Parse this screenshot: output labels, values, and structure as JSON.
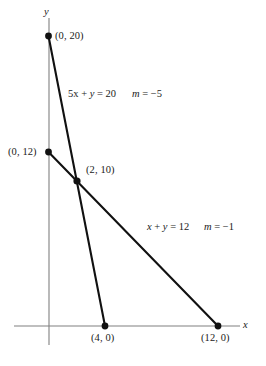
{
  "figure": {
    "background_color": "#ffffff",
    "line_color": "#111111",
    "axis_color": "#808080",
    "text_color": "#1a1a1a"
  },
  "axes": {
    "x_label": "x",
    "y_label": "y",
    "origin_px": [
      49,
      326
    ],
    "x_scale_px_per_unit": 14.1,
    "y_scale_px_per_unit": 14.5
  },
  "points": {
    "p_0_20": "(0, 20)",
    "p_0_12": "(0, 12)",
    "p_2_10": "(2, 10)",
    "p_4_0": "(4, 0)",
    "p_12_0": "(12, 0)"
  },
  "equations": {
    "line1_eq": "5x + y = 20",
    "line1_slope": "m = −5",
    "line2_eq": "x + y = 12",
    "line2_slope": "m = −1"
  },
  "chart_data": {
    "type": "line",
    "title": "",
    "xlabel": "x",
    "ylabel": "y",
    "grid": false,
    "legend": "none",
    "xlim": [
      0,
      14
    ],
    "ylim": [
      0,
      21
    ],
    "series": [
      {
        "name": "5x + y = 20",
        "equation": "5x + y = 20",
        "slope": -5,
        "intercept": 20,
        "points": [
          [
            0,
            20
          ],
          [
            4,
            0
          ]
        ],
        "endpoint_labels": [
          "(0, 20)",
          "(4, 0)"
        ]
      },
      {
        "name": "x + y = 12",
        "equation": "x + y = 12",
        "slope": -1,
        "intercept": 12,
        "points": [
          [
            0,
            12
          ],
          [
            12,
            0
          ]
        ],
        "endpoint_labels": [
          "(0, 12)",
          "(12, 0)"
        ]
      }
    ],
    "intersection": {
      "point": [
        2,
        10
      ],
      "label": "(2, 10)"
    },
    "annotations": [
      {
        "text": "5x + y = 20",
        "x": 4.2,
        "y": 16.5
      },
      {
        "text": "m = −5",
        "x": 8.0,
        "y": 16.5
      },
      {
        "text": "x + y = 12",
        "x": 10.2,
        "y": 7.6
      },
      {
        "text": "m = −1",
        "x": 13.6,
        "y": 7.6
      }
    ]
  }
}
